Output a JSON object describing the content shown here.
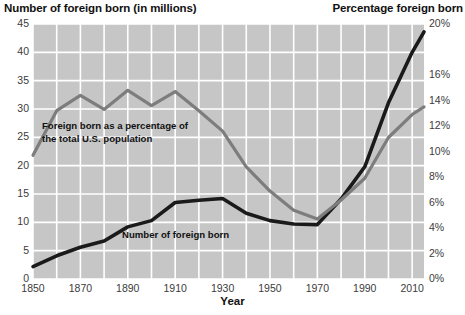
{
  "titles": {
    "left": "Number of foreign born (in millions)",
    "right": "Percentage foreign born",
    "xaxis": "Year"
  },
  "annotations": {
    "percentage_line": "Foreign born as a percentage of",
    "percentage_line2": "the total U.S. population",
    "number_line": "Number of foreign born"
  },
  "colors": {
    "plot_background": "#c6c6c6",
    "gridline": "#ffffff",
    "number_series": "#1a1a1a",
    "percentage_series": "#7d7d7d",
    "text": "#111111",
    "tick_text": "#3b3b3b"
  },
  "chart_data": {
    "type": "line",
    "xlabel": "Year",
    "ylabel": "Number of foreign born (in millions)",
    "y2label": "Percentage foreign born",
    "xlim": [
      1850,
      2015
    ],
    "ylim": [
      0,
      45
    ],
    "y2lim": [
      0,
      20
    ],
    "grid": true,
    "legend": "inline-annotations",
    "xticks": [
      1850,
      1870,
      1890,
      1910,
      1930,
      1950,
      1970,
      1990,
      2010
    ],
    "xticklabels": [
      "1850",
      "1870",
      "1890",
      "1910",
      "1930",
      "1950",
      "1970",
      "1990",
      "2010"
    ],
    "yticks": [
      0,
      5,
      10,
      15,
      20,
      25,
      30,
      35,
      40,
      45
    ],
    "yticklabels": [
      "0",
      "5",
      "10",
      "15",
      "20",
      "25",
      "30",
      "35",
      "40",
      "45"
    ],
    "y2ticks": [
      0,
      2,
      4,
      6,
      8,
      10,
      12,
      14,
      16,
      20
    ],
    "y2ticklabels": [
      "0%",
      "2%",
      "4%",
      "6%",
      "8%",
      "10%",
      "12%",
      "14%",
      "16%",
      "20%"
    ],
    "x": [
      1850,
      1860,
      1870,
      1880,
      1890,
      1900,
      1910,
      1920,
      1930,
      1940,
      1950,
      1960,
      1970,
      1980,
      1990,
      2000,
      2010,
      2015
    ],
    "series": [
      {
        "name": "Number of foreign born",
        "units": "millions",
        "axis": "left",
        "color": "#1a1a1a",
        "values": [
          2.2,
          4.1,
          5.6,
          6.7,
          9.2,
          10.3,
          13.5,
          13.9,
          14.2,
          11.6,
          10.3,
          9.7,
          9.6,
          14.1,
          19.8,
          31.1,
          40.0,
          43.6
        ]
      },
      {
        "name": "Foreign born as a percentage of the total U.S. population",
        "units": "percent",
        "axis": "right",
        "color": "#7d7d7d",
        "values": [
          9.7,
          13.2,
          14.4,
          13.3,
          14.8,
          13.6,
          14.7,
          13.2,
          11.6,
          8.8,
          6.9,
          5.4,
          4.7,
          6.2,
          7.9,
          11.1,
          12.9,
          13.5
        ]
      }
    ]
  }
}
